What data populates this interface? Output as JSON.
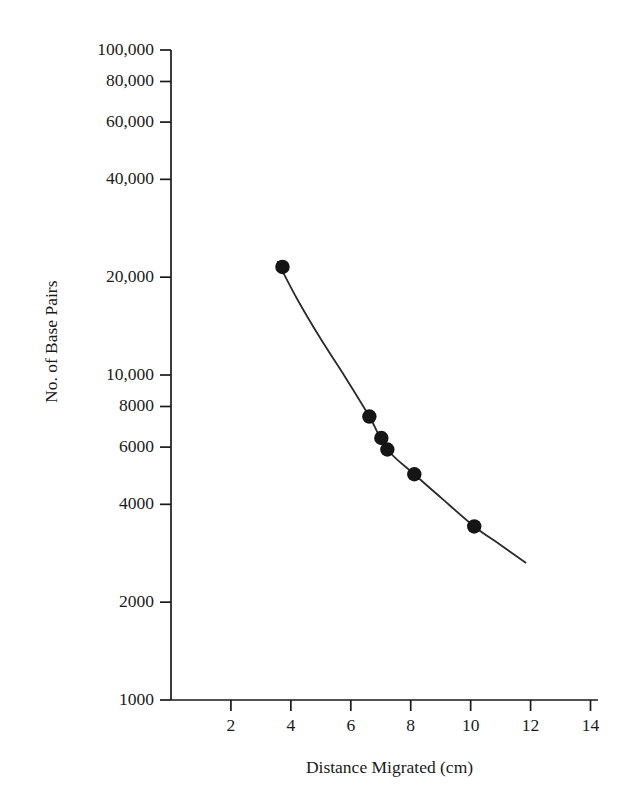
{
  "chart_data": {
    "type": "line",
    "title": "",
    "subtitle": "",
    "xlabel": "Distance Migrated (cm)",
    "ylabel": "No. of Base Pairs",
    "xlim": [
      0,
      14.25
    ],
    "ylim": [
      1000,
      100000
    ],
    "yscale": "log",
    "xscale": "linear",
    "grid": false,
    "legend": null,
    "xticks": [
      {
        "value": 2,
        "label": "2"
      },
      {
        "value": 4,
        "label": "4"
      },
      {
        "value": 6,
        "label": "6"
      },
      {
        "value": 8,
        "label": "8"
      },
      {
        "value": 10,
        "label": "10"
      },
      {
        "value": 12,
        "label": "12"
      },
      {
        "value": 14,
        "label": "14"
      }
    ],
    "yticks": [
      {
        "value": 100000,
        "label": "100,000"
      },
      {
        "value": 80000,
        "label": "80,000"
      },
      {
        "value": 60000,
        "label": "60,000"
      },
      {
        "value": 40000,
        "label": "40,000"
      },
      {
        "value": 20000,
        "label": "20,000"
      },
      {
        "value": 10000,
        "label": "10,000"
      },
      {
        "value": 8000,
        "label": "8000"
      },
      {
        "value": 6000,
        "label": "6000"
      },
      {
        "value": 4000,
        "label": "4000"
      },
      {
        "value": 2000,
        "label": "2000"
      },
      {
        "value": 1000,
        "label": "1000"
      }
    ],
    "series": [
      {
        "name": "DNA standard curve",
        "marker": "filled-circle",
        "marker_color": "#151515",
        "line_color": "#2b2b2b",
        "x": [
          3.72,
          6.62,
          7.02,
          7.22,
          8.12,
          10.12
        ],
        "y": [
          21500,
          7450,
          6400,
          5900,
          4950,
          3420
        ]
      }
    ],
    "fit_curve": {
      "x": [
        3.55,
        4.2,
        5.0,
        5.8,
        6.62,
        7.22,
        8.12,
        9.0,
        10.12,
        11.0,
        11.85
      ],
      "y": [
        22400,
        17200,
        12900,
        9900,
        7450,
        5900,
        4950,
        4200,
        3420,
        3000,
        2640
      ]
    },
    "annotations": []
  },
  "axes": {
    "x_axis_name": "x-axis",
    "y_axis_name": "y-axis"
  }
}
